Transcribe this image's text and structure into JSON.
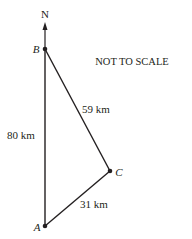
{
  "diagram": {
    "north_label": "N",
    "note": "NOT TO SCALE",
    "points": {
      "A": {
        "label": "A",
        "x": 45,
        "y": 226
      },
      "B": {
        "label": "B",
        "x": 45,
        "y": 49
      },
      "C": {
        "label": "C",
        "x": 110,
        "y": 171
      }
    },
    "sides": {
      "AB": "80 km",
      "BC": "59 km",
      "CA": "31 km"
    },
    "colors": {
      "line": "#231f20",
      "background": "#ffffff"
    }
  }
}
